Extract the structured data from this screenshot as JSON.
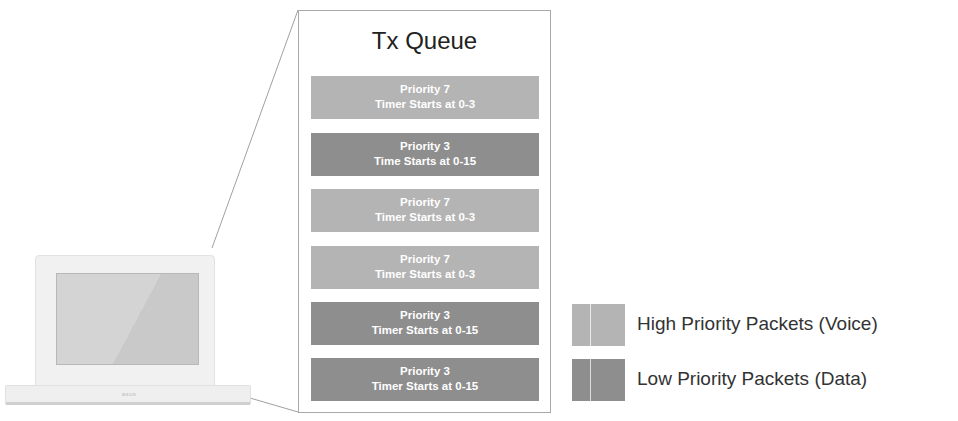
{
  "colors": {
    "high_priority": "#b4b4b4",
    "low_priority": "#8e8e8e",
    "box_border": "#a9a9a9",
    "connector": "#a0a0a0"
  },
  "laptop": {
    "icon": "laptop-icon",
    "logo_text": "asus"
  },
  "queue": {
    "title": "Tx Queue",
    "packets": [
      {
        "priority_label": "Priority 7",
        "timer_label": "Timer Starts at 0-3",
        "class": "high"
      },
      {
        "priority_label": "Priority 3",
        "timer_label": "Time Starts at 0-15",
        "class": "low"
      },
      {
        "priority_label": "Priority 7",
        "timer_label": "Timer Starts at 0-3",
        "class": "high"
      },
      {
        "priority_label": "Priority 7",
        "timer_label": "Timer Starts at 0-3",
        "class": "high"
      },
      {
        "priority_label": "Priority 3",
        "timer_label": "Timer Starts at 0-15",
        "class": "low"
      },
      {
        "priority_label": "Priority 3",
        "timer_label": "Timer Starts at 0-15",
        "class": "low"
      }
    ]
  },
  "legend": {
    "items": [
      {
        "label": "High Priority Packets (Voice)",
        "class": "high"
      },
      {
        "label": "Low Priority Packets (Data)",
        "class": "low"
      }
    ]
  }
}
